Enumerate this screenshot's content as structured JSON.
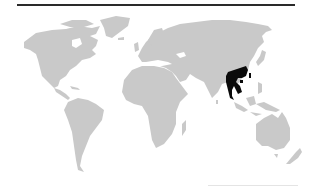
{
  "map": {
    "type": "world-locator-map",
    "projection": "equirectangular-like",
    "land_color": "#c9c9c9",
    "highlight_color": "#0a0a0a",
    "background_color": "#ffffff",
    "highlighted_region": "Mainland Southeast Asia (Indochina)",
    "continents": [
      "North America",
      "South America",
      "Europe",
      "Africa",
      "Asia",
      "Australia",
      "Greenland"
    ]
  },
  "decorations": {
    "top_rule_color": "#2a2a2a",
    "bottom_rule_color": "#e4e4e4"
  }
}
